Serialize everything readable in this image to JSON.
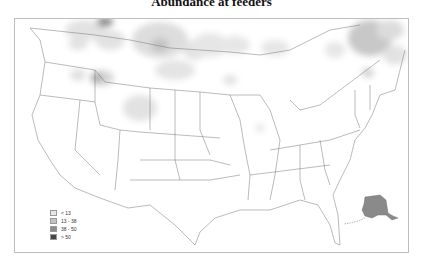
{
  "title": "Abundance at feeders",
  "legend": {
    "items": [
      {
        "label": "< 13",
        "color": "#e6e6e6"
      },
      {
        "label": "13 - 38",
        "color": "#c2c2c2"
      },
      {
        "label": "38 - 50",
        "color": "#8c8c8c"
      },
      {
        "label": "> 50",
        "color": "#454545"
      }
    ]
  },
  "map": {
    "region": "Contiguous United States with southern Canada and Alaska inset",
    "inset": "Alaska",
    "hotspots": [
      {
        "area": "southern Alberta / Saskatchewan",
        "level": "13 - 38"
      },
      {
        "area": "northern Idaho / Montana",
        "level": "38 - 50"
      },
      {
        "area": "Wyoming",
        "level": "13 - 38"
      },
      {
        "area": "southern Quebec",
        "level": "13 - 38"
      },
      {
        "area": "Alaska",
        "level": "38 - 50"
      }
    ]
  }
}
